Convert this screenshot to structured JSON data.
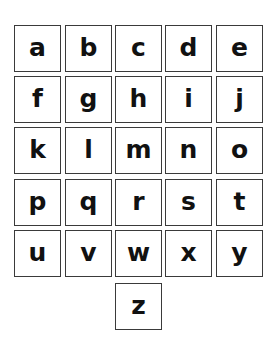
{
  "letters": [
    "a",
    "b",
    "c",
    "d",
    "e",
    "f",
    "g",
    "h",
    "i",
    "j",
    "k",
    "l",
    "m",
    "n",
    "o",
    "p",
    "q",
    "r",
    "s",
    "t",
    "u",
    "v",
    "w",
    "x",
    "y",
    "z"
  ],
  "layout": {
    "columns": 5,
    "rows": 6,
    "last_row_centered": true
  },
  "colors": {
    "background": "#ffffff",
    "border": "#3a3a3a",
    "text": "#111111"
  }
}
